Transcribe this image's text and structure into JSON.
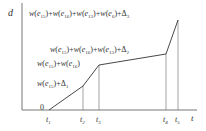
{
  "diagram": {
    "axes": {
      "y_label": "d",
      "x_label": "t",
      "origin_label": "0"
    },
    "ticks": [
      {
        "name": "t",
        "sub": "1"
      },
      {
        "name": "t",
        "sub": "2"
      },
      {
        "name": "t",
        "sub": "3"
      },
      {
        "name": "t",
        "sub": "4"
      },
      {
        "name": "t",
        "sub": "5"
      }
    ],
    "labels": [
      {
        "id": "label-t5",
        "text": "w(e15)+w(e16)+w(e13)+w(e6)+Δ3"
      },
      {
        "id": "label-t4",
        "text": "w(e15)+w(e16)+w(e13)+Δ2"
      },
      {
        "id": "label-t3",
        "text": "w(e15)+w(e16)"
      },
      {
        "id": "label-t2",
        "text": "w(e15)+Δ1"
      }
    ],
    "polyline": [
      {
        "t": "t1",
        "x": 49,
        "y": 110
      },
      {
        "t": "t2",
        "x": 83,
        "y": 86
      },
      {
        "t": "t3",
        "x": 99,
        "y": 65
      },
      {
        "t": "t4",
        "x": 166,
        "y": 54
      },
      {
        "t": "t5",
        "x": 178,
        "y": 20
      }
    ],
    "line_color": "#333333"
  }
}
